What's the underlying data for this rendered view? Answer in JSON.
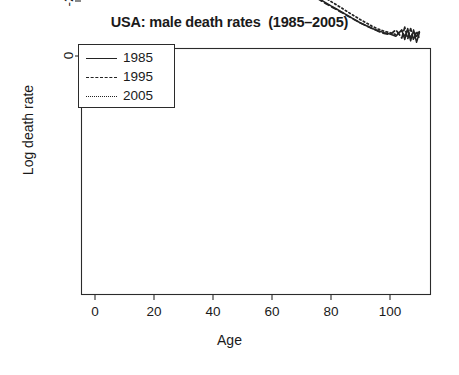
{
  "chart_data": {
    "type": "line",
    "title": "USA: male death rates  (1985–2005)",
    "xlabel": "Age",
    "ylabel": "Log death rate",
    "xlim": [
      -3,
      113
    ],
    "ylim": [
      -9.6,
      0.3
    ],
    "xticks": [
      0,
      20,
      40,
      60,
      80,
      100
    ],
    "xtick_labels": [
      "0",
      "20",
      "40",
      "60",
      "80",
      "100"
    ],
    "yticks": [
      0,
      -2,
      -4,
      -6,
      -8
    ],
    "ytick_labels": [
      "0",
      "-2",
      "-4",
      "-6",
      "-8"
    ],
    "grid": false,
    "legend_position": "top-left",
    "legend": [
      "1985",
      "1995",
      "2005"
    ],
    "annotations": [
      {
        "type": "circle",
        "center_age": 36.5,
        "center_value": -5.5,
        "radius_px": 46,
        "note": "highlighted age range ~20–50"
      }
    ],
    "series": [
      {
        "name": "1985",
        "style": "solid",
        "x": [
          0,
          1,
          2,
          3,
          4,
          5,
          6,
          7,
          8,
          9,
          10,
          11,
          12,
          13,
          14,
          15,
          16,
          17,
          18,
          19,
          20,
          22,
          24,
          26,
          28,
          30,
          32,
          34,
          36,
          38,
          40,
          42,
          44,
          46,
          48,
          50,
          52,
          54,
          56,
          58,
          60,
          62,
          64,
          66,
          68,
          70,
          72,
          74,
          76,
          78,
          80,
          82,
          84,
          86,
          88,
          90,
          92,
          94,
          96,
          98,
          100,
          102,
          104,
          105,
          106,
          107,
          108,
          109,
          110
        ],
        "y": [
          -4.55,
          -6.75,
          -7.45,
          -7.75,
          -7.95,
          -8.1,
          -8.2,
          -8.28,
          -8.33,
          -8.36,
          -8.35,
          -8.3,
          -8.18,
          -7.95,
          -7.6,
          -7.25,
          -6.95,
          -6.7,
          -6.5,
          -6.35,
          -6.25,
          -6.18,
          -6.15,
          -6.12,
          -6.05,
          -5.95,
          -5.82,
          -5.68,
          -5.52,
          -5.35,
          -5.18,
          -5.0,
          -4.82,
          -4.62,
          -4.42,
          -4.22,
          -4.02,
          -3.82,
          -3.62,
          -3.45,
          -3.28,
          -3.1,
          -2.95,
          -2.8,
          -2.65,
          -2.5,
          -2.35,
          -2.2,
          -2.08,
          -1.95,
          -1.82,
          -1.7,
          -1.58,
          -1.45,
          -1.32,
          -1.2,
          -1.1,
          -1.0,
          -0.92,
          -0.85,
          -0.8,
          -0.72,
          -0.95,
          -0.6,
          -1.0,
          -0.55,
          -0.95,
          -0.5,
          -0.85
        ]
      },
      {
        "name": "1995",
        "style": "dashed",
        "x": [
          0,
          1,
          2,
          3,
          4,
          5,
          6,
          7,
          8,
          9,
          10,
          11,
          12,
          13,
          14,
          15,
          16,
          17,
          18,
          19,
          20,
          22,
          24,
          26,
          28,
          30,
          32,
          34,
          36,
          38,
          40,
          42,
          44,
          46,
          48,
          50,
          52,
          54,
          56,
          58,
          60,
          62,
          64,
          66,
          68,
          70,
          72,
          74,
          76,
          78,
          80,
          82,
          84,
          86,
          88,
          90,
          92,
          94,
          96,
          98,
          100,
          102,
          104,
          105,
          106,
          107,
          108,
          109,
          110
        ],
        "y": [
          -4.6,
          -6.95,
          -7.7,
          -8.0,
          -8.2,
          -8.35,
          -8.45,
          -8.52,
          -8.56,
          -8.58,
          -8.56,
          -8.5,
          -8.35,
          -8.1,
          -7.72,
          -7.35,
          -7.05,
          -6.82,
          -6.62,
          -6.45,
          -6.32,
          -6.2,
          -6.12,
          -6.0,
          -5.9,
          -5.8,
          -5.68,
          -5.55,
          -5.4,
          -5.22,
          -5.05,
          -4.88,
          -4.7,
          -4.5,
          -4.3,
          -4.1,
          -3.9,
          -3.72,
          -3.54,
          -3.36,
          -3.2,
          -3.04,
          -2.9,
          -2.75,
          -2.6,
          -2.46,
          -2.32,
          -2.18,
          -2.05,
          -1.92,
          -1.8,
          -1.68,
          -1.56,
          -1.44,
          -1.32,
          -1.2,
          -1.1,
          -1.0,
          -0.9,
          -0.82,
          -0.78,
          -0.95,
          -0.65,
          -1.05,
          -0.62,
          -1.0,
          -0.58,
          -0.9,
          -0.62
        ]
      },
      {
        "name": "2005",
        "style": "dotted",
        "x": [
          0,
          1,
          2,
          3,
          4,
          5,
          6,
          7,
          8,
          9,
          10,
          11,
          12,
          13,
          14,
          15,
          16,
          17,
          18,
          19,
          20,
          22,
          24,
          26,
          28,
          30,
          32,
          34,
          36,
          38,
          40,
          42,
          44,
          46,
          48,
          50,
          52,
          54,
          56,
          58,
          60,
          62,
          64,
          66,
          68,
          70,
          72,
          74,
          76,
          78,
          80,
          82,
          84,
          86,
          88,
          90,
          92,
          94,
          96,
          98,
          100,
          102,
          104,
          105,
          106,
          107,
          108,
          109,
          110
        ],
        "y": [
          -4.68,
          -7.2,
          -7.95,
          -8.3,
          -8.5,
          -8.65,
          -8.75,
          -8.82,
          -8.88,
          -8.9,
          -8.88,
          -8.82,
          -8.68,
          -8.42,
          -8.0,
          -7.6,
          -7.3,
          -7.08,
          -6.88,
          -6.7,
          -6.56,
          -6.45,
          -6.4,
          -6.38,
          -6.32,
          -6.22,
          -6.1,
          -5.95,
          -5.78,
          -5.6,
          -5.42,
          -5.22,
          -5.02,
          -4.82,
          -4.6,
          -4.4,
          -4.2,
          -4.0,
          -3.8,
          -3.62,
          -3.45,
          -3.28,
          -3.12,
          -2.98,
          -2.82,
          -2.68,
          -2.54,
          -2.4,
          -2.26,
          -2.12,
          -1.98,
          -1.85,
          -1.72,
          -1.58,
          -1.45,
          -1.32,
          -1.2,
          -1.08,
          -0.98,
          -0.9,
          -0.85,
          -0.78,
          -0.92,
          -0.7,
          -0.95,
          -0.68,
          -0.88,
          -0.72,
          -0.9
        ]
      }
    ]
  }
}
